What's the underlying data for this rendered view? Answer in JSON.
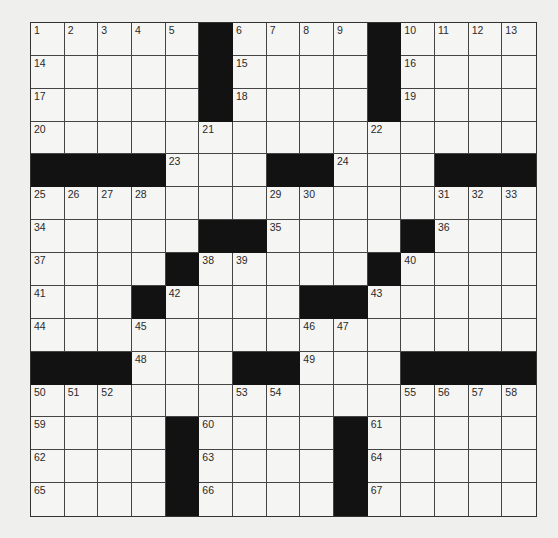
{
  "puzzle": {
    "size": {
      "rows": 15,
      "cols": 15
    },
    "colors": {
      "block": "#121212",
      "cell": "#f5f5f3",
      "line": "#444444",
      "background": "#efefed"
    },
    "layout": [
      "#####B#####B####",
      "ignore"
    ],
    "rows": [
      [
        1,
        2,
        3,
        4,
        5,
        "#",
        6,
        7,
        8,
        9,
        "#",
        10,
        11,
        12,
        13
      ],
      [
        14,
        0,
        0,
        0,
        0,
        "#",
        15,
        0,
        0,
        0,
        "#",
        16,
        0,
        0,
        0
      ],
      [
        17,
        0,
        0,
        0,
        0,
        "#",
        18,
        0,
        0,
        0,
        "#",
        19,
        0,
        0,
        0
      ],
      [
        20,
        0,
        0,
        0,
        0,
        21,
        0,
        0,
        0,
        0,
        22,
        0,
        0,
        0,
        0
      ],
      [
        "#",
        "#",
        "#",
        "#",
        23,
        0,
        0,
        "#",
        "#",
        24,
        0,
        0,
        "#",
        "#",
        "#"
      ],
      [
        25,
        26,
        27,
        28,
        0,
        0,
        0,
        29,
        30,
        0,
        0,
        0,
        31,
        32,
        33
      ],
      [
        34,
        0,
        0,
        0,
        0,
        "#",
        "#",
        35,
        0,
        0,
        0,
        "#",
        36,
        0,
        0
      ],
      [
        37,
        0,
        0,
        0,
        "#",
        38,
        39,
        0,
        0,
        0,
        "#",
        40,
        0,
        0,
        0
      ],
      [
        41,
        0,
        0,
        "#",
        42,
        0,
        0,
        0,
        "#",
        "#",
        43,
        0,
        0,
        0,
        0
      ],
      [
        44,
        0,
        0,
        45,
        0,
        0,
        0,
        0,
        46,
        47,
        0,
        0,
        0,
        0,
        0
      ],
      [
        "#",
        "#",
        "#",
        48,
        0,
        0,
        "#",
        "#",
        49,
        0,
        0,
        "#",
        "#",
        "#",
        "#"
      ],
      [
        50,
        51,
        52,
        0,
        0,
        0,
        53,
        54,
        0,
        0,
        0,
        55,
        56,
        57,
        58
      ],
      [
        59,
        0,
        0,
        0,
        "#",
        60,
        0,
        0,
        0,
        "#",
        61,
        0,
        0,
        0,
        0
      ],
      [
        62,
        0,
        0,
        0,
        "#",
        63,
        0,
        0,
        0,
        "#",
        64,
        0,
        0,
        0,
        0
      ],
      [
        65,
        0,
        0,
        0,
        "#",
        66,
        0,
        0,
        0,
        "#",
        67,
        0,
        0,
        0,
        0
      ]
    ],
    "entries": {}
  }
}
